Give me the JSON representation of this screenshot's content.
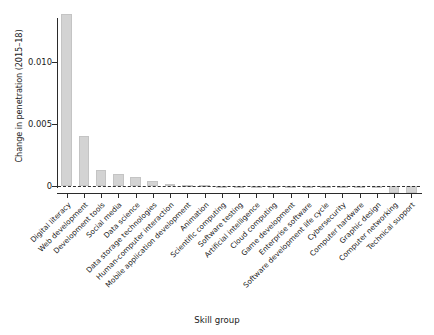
{
  "chart_data": {
    "type": "bar",
    "title": "",
    "subtitle": "",
    "xlabel": "Skill group",
    "ylabel": "Change in penetration (2015–18)",
    "categories": [
      "Digital literacy",
      "Web development",
      "Development tools",
      "Social media",
      "Data science",
      "Data storage technologies",
      "Human-computer interaction",
      "Mobile application development",
      "Animation",
      "Scientific computing",
      "Software testing",
      "Artificial intelligence",
      "Cloud computing",
      "Game development",
      "Enterprise software",
      "Software development life cycle",
      "Cybersecurity",
      "Computer hardware",
      "Graphic design",
      "Computer networking",
      "Technical support"
    ],
    "values": [
      0.0139,
      0.004,
      0.0013,
      0.001,
      0.0007,
      0.0004,
      0.0002,
      0.0001,
      5e-05,
      4e-05,
      3e-05,
      2e-05,
      1e-05,
      1e-05,
      5e-06,
      5e-06,
      5e-06,
      5e-06,
      -0.0002,
      -0.0006,
      -0.0006
    ],
    "ytick_values": [
      0,
      0.005,
      0.01
    ],
    "ytick_labels": [
      "0",
      "0.005",
      "0.010"
    ],
    "ylim": [
      -0.0012,
      0.015
    ],
    "xlim_categories": 21,
    "grid": false,
    "legend": null,
    "zero_reference_line": true,
    "bar_color": "#d3d3d3",
    "axis_color": "#2b2b2b"
  },
  "axes": {
    "y_title": "Change in penetration (2015–18)",
    "x_title": "Skill group"
  }
}
